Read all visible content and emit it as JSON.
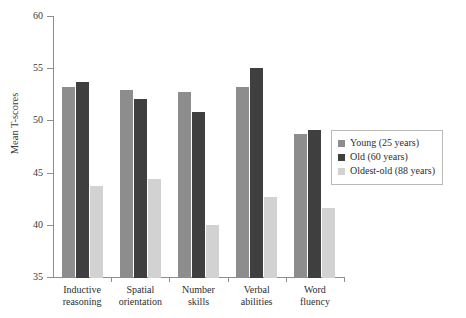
{
  "chart_data": {
    "type": "bar",
    "title": "",
    "xlabel": "",
    "ylabel": "Mean T-scores",
    "ylim": [
      35,
      60
    ],
    "yticks": [
      35,
      40,
      45,
      50,
      55,
      60
    ],
    "grid": false,
    "legend_position": "right",
    "categories": [
      "Inductive reasoning",
      "Spatial orientation",
      "Number skills",
      "Verbal abilities",
      "Word fluency"
    ],
    "category_lines": [
      [
        "Inductive",
        "reasoning"
      ],
      [
        "Spatial",
        "orientation"
      ],
      [
        "Number",
        "skills"
      ],
      [
        "Verbal",
        "abilities"
      ],
      [
        "Word",
        "fluency"
      ]
    ],
    "series": [
      {
        "name": "Young (25 years)",
        "color": "#8d8d8d",
        "values": [
          53.3,
          53.0,
          52.8,
          53.3,
          48.8
        ]
      },
      {
        "name": "Old (60 years)",
        "color": "#3f3f3f",
        "values": [
          53.8,
          52.1,
          50.9,
          55.1,
          49.2
        ]
      },
      {
        "name": "Oldest-old (88 years)",
        "color": "#d2d2d2",
        "values": [
          43.8,
          44.5,
          40.1,
          42.8,
          41.7
        ]
      }
    ]
  }
}
